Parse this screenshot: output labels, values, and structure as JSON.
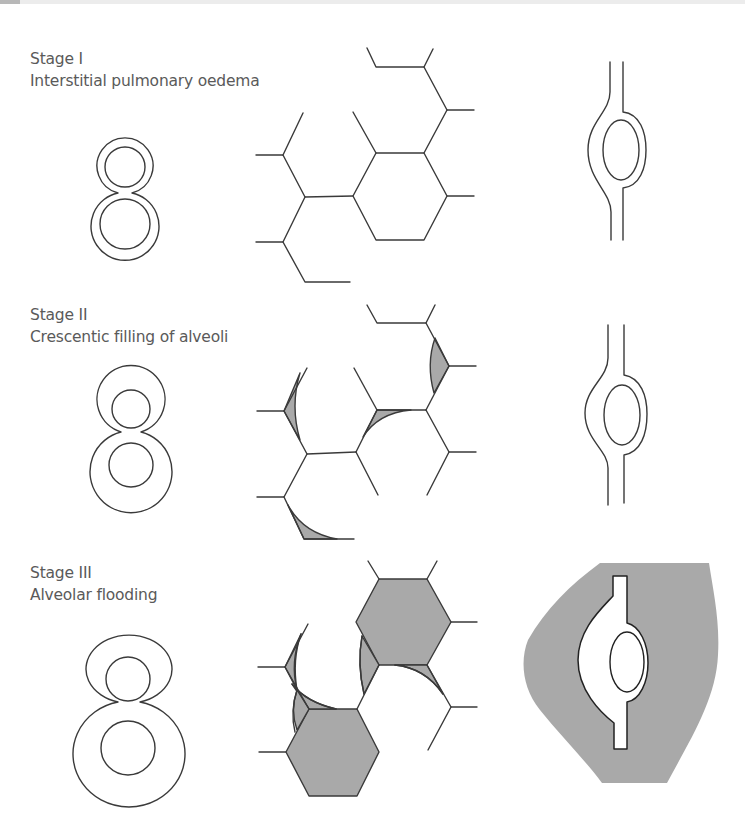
{
  "figure": {
    "stages": [
      {
        "stage": "Stage I",
        "description": "Interstitial pulmonary oedema"
      },
      {
        "stage": "Stage II",
        "description": "Crescentic filling of alveoli"
      },
      {
        "stage": "Stage III",
        "description": "Alveolar flooding"
      }
    ],
    "columns": [
      "alveolus cross-section (figure-of-eight)",
      "alveolar network (hexagons)",
      "capillary in interstitium"
    ],
    "colors": {
      "line": "#3a3a3a",
      "fluid_fill": "#a9a9a9",
      "background": "#ffffff",
      "text": "#5a5a5a"
    }
  }
}
